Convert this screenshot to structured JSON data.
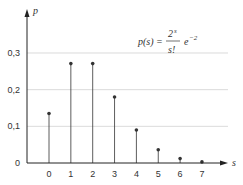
{
  "chart_data": {
    "type": "bar",
    "subtype": "stem",
    "title": "",
    "annotation": {
      "lhs": "p(s) =",
      "numerator": "2",
      "numerator_exp": "s",
      "denominator": "s!",
      "factor": "e",
      "factor_exp": "−2"
    },
    "xlabel": "s",
    "ylabel": "p",
    "categories": [
      "0",
      "1",
      "2",
      "3",
      "4",
      "5",
      "6",
      "7"
    ],
    "x": [
      0,
      1,
      2,
      3,
      4,
      5,
      6,
      7
    ],
    "values": [
      0.135,
      0.271,
      0.271,
      0.18,
      0.09,
      0.036,
      0.012,
      0.003
    ],
    "yticks": [
      "0",
      "0,1",
      "0,2",
      "0,3"
    ],
    "ytick_values": [
      0,
      0.1,
      0.2,
      0.3
    ],
    "ylim": [
      0,
      0.35
    ],
    "xlim": [
      -0.5,
      7.5
    ],
    "grid": true,
    "legend": null,
    "colors": {
      "stem": "#333333",
      "grid": "#d0d0d0",
      "axis": "#222222"
    }
  }
}
